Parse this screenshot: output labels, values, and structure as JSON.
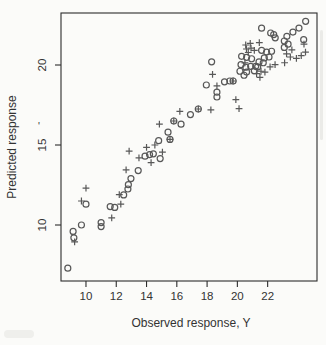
{
  "figure": {
    "background": "#fbfbf9",
    "ink": "#585858",
    "border_color": "#2c2c2c",
    "text_color": "#333333"
  },
  "artifacts": {
    "stray_mark": "'"
  },
  "chart_data": {
    "type": "scatter",
    "title": "",
    "xlabel": "Observed response, Y",
    "ylabel": "Predicted response",
    "xlim": [
      8.35,
      25.26
    ],
    "ylim": [
      6.5,
      23.25
    ],
    "x_ticks": [
      10,
      12,
      14,
      16,
      18,
      20,
      22
    ],
    "y_ticks": [
      10,
      15,
      20
    ],
    "grid": false,
    "legend": "none",
    "series": [
      {
        "name": "circle-markers",
        "marker": "o",
        "points": [
          [
            8.8,
            7.3
          ],
          [
            9.15,
            9.6
          ],
          [
            9.2,
            9.2
          ],
          [
            9.7,
            10.0
          ],
          [
            10.0,
            11.3
          ],
          [
            11.0,
            10.15
          ],
          [
            11.0,
            9.9
          ],
          [
            11.6,
            11.15
          ],
          [
            11.9,
            11.1
          ],
          [
            12.49,
            11.88
          ],
          [
            12.77,
            12.25
          ],
          [
            12.8,
            12.52
          ],
          [
            12.97,
            12.9
          ],
          [
            13.45,
            13.4
          ],
          [
            13.9,
            14.3
          ],
          [
            14.2,
            14.4
          ],
          [
            14.45,
            14.45
          ],
          [
            14.9,
            14.15
          ],
          [
            14.8,
            15.27
          ],
          [
            15.42,
            15.8
          ],
          [
            15.55,
            15.35
          ],
          [
            16.28,
            16.3
          ],
          [
            15.8,
            16.5
          ],
          [
            16.9,
            16.9
          ],
          [
            17.42,
            17.25
          ],
          [
            17.95,
            18.75
          ],
          [
            18.65,
            18.3
          ],
          [
            18.65,
            18.0
          ],
          [
            18.3,
            20.2
          ],
          [
            19.15,
            18.95
          ],
          [
            19.5,
            19.0
          ],
          [
            19.72,
            19.0
          ],
          [
            20.28,
            20.54
          ],
          [
            20.61,
            20.48
          ],
          [
            20.94,
            20.39
          ],
          [
            20.24,
            20.02
          ],
          [
            20.55,
            19.86
          ],
          [
            20.88,
            19.92
          ],
          [
            21.21,
            19.92
          ],
          [
            20.17,
            19.61
          ],
          [
            20.61,
            19.56
          ],
          [
            20.44,
            19.36
          ],
          [
            21.12,
            19.64
          ],
          [
            21.6,
            20.92
          ],
          [
            21.93,
            20.81
          ],
          [
            22.26,
            20.86
          ],
          [
            21.78,
            20.44
          ],
          [
            22.09,
            20.5
          ],
          [
            21.43,
            20.19
          ],
          [
            21.71,
            20.14
          ],
          [
            21.34,
            19.88
          ],
          [
            21.6,
            22.3
          ],
          [
            22.2,
            22.0
          ],
          [
            22.4,
            21.9
          ],
          [
            22.5,
            21.7
          ],
          [
            23.1,
            21.5
          ],
          [
            23.35,
            21.3
          ],
          [
            23.1,
            21.1
          ],
          [
            23.27,
            21.79
          ],
          [
            23.67,
            22.06
          ],
          [
            24.07,
            22.31
          ],
          [
            24.51,
            22.73
          ],
          [
            24.38,
            21.58
          ]
        ]
      },
      {
        "name": "plus-markers",
        "marker": "+",
        "points": [
          [
            9.25,
            8.95
          ],
          [
            9.7,
            11.5
          ],
          [
            10.0,
            12.3
          ],
          [
            11.7,
            10.45
          ],
          [
            12.2,
            11.9
          ],
          [
            12.3,
            11.3
          ],
          [
            12.65,
            13.45
          ],
          [
            12.85,
            14.62
          ],
          [
            13.5,
            14.2
          ],
          [
            14.0,
            14.85
          ],
          [
            14.3,
            13.9
          ],
          [
            14.55,
            15.0
          ],
          [
            15.05,
            14.55
          ],
          [
            14.85,
            16.3
          ],
          [
            16.2,
            17.1
          ],
          [
            15.55,
            15.35
          ],
          [
            15.8,
            16.5
          ],
          [
            17.42,
            17.25
          ],
          [
            18.25,
            17.2
          ],
          [
            19.9,
            17.83
          ],
          [
            20.11,
            17.27
          ],
          [
            18.36,
            19.42
          ],
          [
            18.65,
            18.7
          ],
          [
            19.72,
            19.0
          ],
          [
            20.55,
            21.25
          ],
          [
            20.85,
            21.35
          ],
          [
            21.45,
            21.4
          ],
          [
            20.6,
            21.0
          ],
          [
            20.9,
            21.05
          ],
          [
            21.12,
            20.92
          ],
          [
            20.72,
            20.78
          ],
          [
            20.5,
            20.13
          ],
          [
            21.56,
            19.61
          ],
          [
            21.82,
            19.56
          ],
          [
            21.27,
            19.46
          ],
          [
            21.49,
            19.23
          ],
          [
            22.49,
            20.02
          ],
          [
            22.16,
            19.88
          ],
          [
            23.12,
            20.14
          ],
          [
            23.25,
            20.7
          ],
          [
            23.5,
            20.5
          ],
          [
            23.6,
            20.95
          ],
          [
            23.9,
            20.42
          ],
          [
            24.22,
            20.58
          ],
          [
            24.5,
            20.8
          ],
          [
            24.4,
            21.3
          ]
        ]
      }
    ]
  }
}
